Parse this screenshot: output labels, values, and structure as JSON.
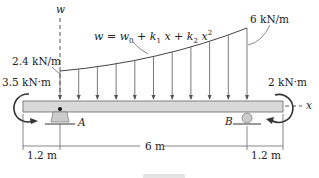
{
  "diagram": {
    "type": "beam-loading",
    "axis_labels": {
      "vertical": "w",
      "horizontal": "x"
    },
    "load_equation": {
      "w": "w",
      "eq": " = w",
      "w0_sub": "0",
      "k1": " + k",
      "k1_sub": "1",
      "x1": "x + k",
      "k2_sub": "2",
      "x2": "x",
      "x2_sup": "2"
    },
    "load_start_label": "2.4 kN/m",
    "load_end_label": "6 kN/m",
    "left_moment_label": "3.5 kN·m",
    "right_moment_label": "2 kN·m",
    "support_a_label": "A",
    "support_b_label": "B",
    "dimensions": [
      "1.2 m",
      "6 m",
      "1.2 m"
    ],
    "load_arrow_count": 11,
    "colors": {
      "beam_fill": "#d9d9d9",
      "line": "#333333",
      "support_fill": "#cccccc"
    }
  }
}
